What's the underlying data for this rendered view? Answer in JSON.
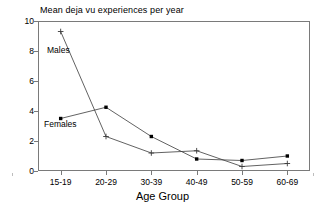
{
  "chart_data": {
    "type": "line",
    "title": "Mean deja vu experiences per year",
    "xlabel": "Age Group",
    "ylabel": "",
    "categories": [
      "15-19",
      "20-29",
      "30-39",
      "40-49",
      "50-59",
      "60-69"
    ],
    "series": [
      {
        "name": "Males",
        "marker": "plus",
        "values": [
          9.3,
          2.3,
          1.2,
          1.35,
          0.3,
          0.5
        ]
      },
      {
        "name": "Females",
        "marker": "dot",
        "values": [
          3.5,
          4.25,
          2.3,
          0.8,
          0.7,
          1.0
        ]
      }
    ],
    "ylim": [
      0,
      10
    ],
    "yticks": [
      0,
      2,
      4,
      6,
      8,
      10
    ],
    "grid": false,
    "legend_position": "inline-annotations",
    "annotations": [
      {
        "text": "Males",
        "series": "Males"
      },
      {
        "text": "Females",
        "series": "Females"
      }
    ]
  },
  "axis": {
    "y_tick_labels": [
      "10",
      "8",
      "6",
      "4",
      "2",
      "0"
    ],
    "x_tick_labels": [
      "15-19",
      "20-29",
      "30-39",
      "40-49",
      "50-59",
      "60-69"
    ],
    "x_title": "Age Group"
  },
  "labels": {
    "males": "Males",
    "females": "Females"
  },
  "colors": {
    "line": "#3a3a3a",
    "marker": "#000000",
    "frame": "#7a7a7a",
    "background": "#ffffff"
  }
}
